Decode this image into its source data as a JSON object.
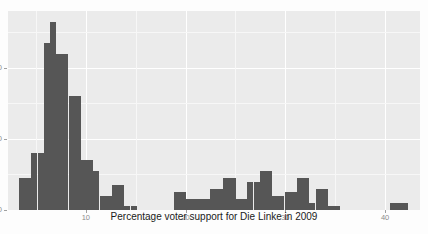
{
  "figure": {
    "panel_bg": "#ebebeb",
    "grid_color": "#ffffff",
    "bar_color": "#565656",
    "page_bg": "#ffffff"
  },
  "chart_data": {
    "type": "bar",
    "subtype": "histogram",
    "title": "",
    "xlabel": "Percentage voter support for Die Linke in 2009",
    "ylabel": "",
    "grid": true,
    "legend": null,
    "xlim": [
      2.2,
      43.5
    ],
    "ylim": [
      0,
      56
    ],
    "xticks": [
      10,
      20,
      30,
      40
    ],
    "xtick_labels": [
      "10",
      "20",
      "30",
      "40"
    ],
    "yticks": [
      0,
      20,
      40
    ],
    "ytick_labels": [
      "0",
      "20",
      "40"
    ],
    "bin_width": 0.62,
    "bin_centers": [
      3.6,
      4.2,
      4.8,
      5.5,
      6.1,
      6.7,
      7.3,
      7.9,
      8.6,
      9.2,
      9.8,
      10.4,
      11.0,
      11.7,
      12.3,
      12.9,
      13.5,
      14.1,
      14.8,
      15.4,
      16.0,
      16.6,
      17.2,
      17.9,
      18.5,
      19.1,
      19.7,
      20.3,
      21.0,
      21.6,
      22.2,
      22.8,
      23.4,
      24.1,
      24.7,
      25.3,
      25.9,
      26.5,
      27.2,
      27.8,
      28.4,
      29.0,
      29.6,
      30.3,
      30.9,
      31.5,
      32.1,
      32.7,
      33.4,
      34.0,
      34.6,
      35.2,
      35.8,
      36.5,
      37.1,
      37.7,
      38.3,
      38.9,
      39.6,
      40.2,
      40.8,
      41.4,
      42.0,
      42.6
    ],
    "counts": [
      9,
      9,
      16,
      16,
      47,
      53,
      44,
      44,
      32,
      32,
      14,
      14,
      11,
      4,
      4,
      7,
      7,
      1,
      1,
      0,
      0,
      0,
      0,
      0,
      0,
      5,
      5,
      3,
      3,
      3,
      3,
      6,
      6,
      9,
      9,
      3,
      3,
      8,
      8,
      11,
      11,
      4,
      4,
      5,
      5,
      9,
      9,
      2,
      6,
      6,
      1,
      1,
      0,
      0,
      0,
      0,
      0,
      0,
      0,
      0,
      2,
      2,
      2,
      0
    ]
  },
  "axis": {
    "x_title": "Percentage voter support for Die Linke in 2009"
  }
}
